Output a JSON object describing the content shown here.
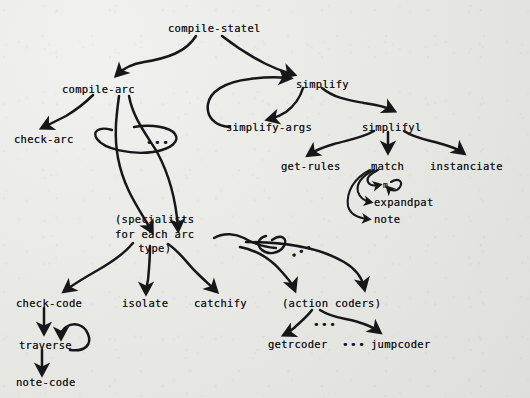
{
  "diagram": {
    "medium": "hand-drawn ink on paper, photocopied",
    "background_color": "#e9e9e6",
    "ink_color": "#17171a",
    "nodes": [
      {
        "id": "compile-state1",
        "label": "compile-statel",
        "x": 168,
        "y": 22,
        "kind": "root"
      },
      {
        "id": "compile-arc",
        "label": "compile-arc",
        "x": 62,
        "y": 83,
        "kind": "proc"
      },
      {
        "id": "check-arc",
        "label": "check-arc",
        "x": 14,
        "y": 133,
        "kind": "proc"
      },
      {
        "id": "simplify",
        "label": "simplify",
        "x": 296,
        "y": 78,
        "kind": "proc"
      },
      {
        "id": "simplify-args",
        "label": "simplify-args",
        "x": 226,
        "y": 121,
        "kind": "proc"
      },
      {
        "id": "simplify1",
        "label": "simplifyl",
        "x": 362,
        "y": 121,
        "kind": "proc"
      },
      {
        "id": "get-rules",
        "label": "get-rules",
        "x": 281,
        "y": 160,
        "kind": "proc"
      },
      {
        "id": "match",
        "label": "match",
        "x": 371,
        "y": 160,
        "kind": "proc"
      },
      {
        "id": "instanciate",
        "label": "instanciate",
        "x": 430,
        "y": 160,
        "kind": "proc"
      },
      {
        "id": "m",
        "label": "m",
        "x": 383,
        "y": 183,
        "kind": "tiny"
      },
      {
        "id": "expandpat",
        "label": "expandpat",
        "x": 374,
        "y": 201,
        "kind": "proc"
      },
      {
        "id": "note",
        "label": "note",
        "x": 374,
        "y": 218,
        "kind": "proc"
      },
      {
        "id": "specialists",
        "label": "(specialists\nfor each arc\ntype)",
        "x": 115,
        "y": 215,
        "kind": "group"
      },
      {
        "id": "check-code",
        "label": "check-code",
        "x": 16,
        "y": 297,
        "kind": "proc"
      },
      {
        "id": "isolate",
        "label": "isolate",
        "x": 122,
        "y": 297,
        "kind": "proc"
      },
      {
        "id": "catchify",
        "label": "catchify",
        "x": 194,
        "y": 297,
        "kind": "proc"
      },
      {
        "id": "action-coders",
        "label": "(action coders)",
        "x": 282,
        "y": 297,
        "kind": "group"
      },
      {
        "id": "traverse",
        "label": "traverse",
        "x": 19,
        "y": 339,
        "kind": "proc"
      },
      {
        "id": "note-code",
        "label": "note-code",
        "x": 16,
        "y": 379,
        "kind": "proc"
      },
      {
        "id": "getrcoder",
        "label": "getrcoder",
        "x": 268,
        "y": 339,
        "kind": "proc"
      },
      {
        "id": "jumpcoder",
        "label": "jumpcoder",
        "x": 371,
        "y": 339,
        "kind": "proc"
      }
    ],
    "ellipsis_marks": [
      {
        "id": "ellipsis-compile-arc-fanout",
        "label": "•••",
        "x": 146,
        "y": 140
      },
      {
        "id": "ellipsis-specialists-fanout",
        "label": "•••",
        "x": 290,
        "y": 249
      },
      {
        "id": "ellipsis-action-coders-fanout",
        "label": "•••",
        "x": 313,
        "y": 322
      },
      {
        "id": "ellipsis-coders-row",
        "label": "•••",
        "x": 342,
        "y": 339
      }
    ],
    "edges": [
      {
        "from": "compile-state1",
        "to": "compile-arc"
      },
      {
        "from": "compile-state1",
        "to": "simplify"
      },
      {
        "from": "compile-arc",
        "to": "check-arc"
      },
      {
        "from": "compile-arc",
        "to": "specialists",
        "note": "fan-out bundle with ellipsis lasso"
      },
      {
        "from": "simplify",
        "to": "simplify-args"
      },
      {
        "from": "simplify-args",
        "to": "simplify",
        "note": "loops back"
      },
      {
        "from": "simplify",
        "to": "simplify1"
      },
      {
        "from": "simplify1",
        "to": "get-rules"
      },
      {
        "from": "simplify1",
        "to": "match"
      },
      {
        "from": "simplify1",
        "to": "instanciate"
      },
      {
        "from": "match",
        "to": "m"
      },
      {
        "from": "m",
        "to": "m",
        "note": "self loop"
      },
      {
        "from": "match",
        "to": "expandpat"
      },
      {
        "from": "match",
        "to": "note"
      },
      {
        "from": "specialists",
        "to": "check-code"
      },
      {
        "from": "specialists",
        "to": "isolate"
      },
      {
        "from": "specialists",
        "to": "catchify"
      },
      {
        "from": "specialists",
        "to": "action-coders",
        "note": "fan-out bundle with ellipsis lasso"
      },
      {
        "from": "check-code",
        "to": "traverse"
      },
      {
        "from": "traverse",
        "to": "traverse",
        "note": "self loop"
      },
      {
        "from": "traverse",
        "to": "note-code"
      },
      {
        "from": "action-coders",
        "to": "getrcoder"
      },
      {
        "from": "action-coders",
        "to": "jumpcoder"
      }
    ]
  }
}
